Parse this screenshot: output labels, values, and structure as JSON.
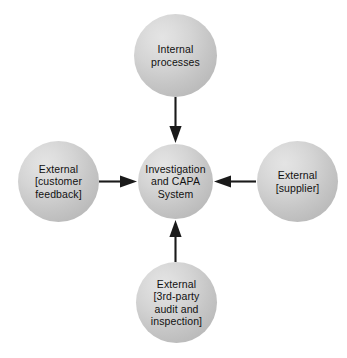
{
  "diagram": {
    "background_color": "#ffffff",
    "node_fill_color": "#cfcfcf",
    "arrow_color": "#1a1a1a",
    "text_color": "#111111",
    "nodes": {
      "center": {
        "id": "investigation-and-capa-system",
        "label": "Investigation\nand CAPA\nSystem",
        "role": "system"
      },
      "top": {
        "id": "internal-processes",
        "label": "Internal\nprocesses",
        "role": "input-source"
      },
      "left": {
        "id": "external-customer-feedback",
        "label": "External\n[customer\nfeedback]",
        "role": "input-source"
      },
      "right": {
        "id": "external-supplier",
        "label": "External\n[supplier]",
        "role": "input-source"
      },
      "bottom": {
        "id": "external-3rd-party-audit-and-inspection",
        "label": "External\n[3rd-party\naudit and\ninspection]",
        "role": "input-source"
      }
    },
    "connections": [
      {
        "from": "internal-processes",
        "to": "investigation-and-capa-system",
        "direction": "down",
        "style": "solid-arrow"
      },
      {
        "from": "external-customer-feedback",
        "to": "investigation-and-capa-system",
        "direction": "right",
        "style": "solid-arrow"
      },
      {
        "from": "external-supplier",
        "to": "investigation-and-capa-system",
        "direction": "left",
        "style": "solid-arrow"
      },
      {
        "from": "external-3rd-party-audit-and-inspection",
        "to": "investigation-and-capa-system",
        "direction": "up",
        "style": "solid-arrow"
      }
    ]
  }
}
